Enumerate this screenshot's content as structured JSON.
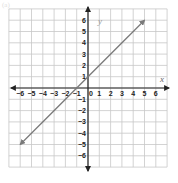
{
  "figure_label": "(a)",
  "chart_data": {
    "type": "line",
    "title": "",
    "xlabel": "x",
    "ylabel": "y",
    "xlim": [
      -6,
      6
    ],
    "ylim": [
      -6,
      6
    ],
    "grid": true,
    "x_ticks": [
      -6,
      -5,
      -4,
      -3,
      -2,
      -1,
      0,
      1,
      2,
      3,
      4,
      5,
      6
    ],
    "y_ticks": [
      -6,
      -5,
      -4,
      -3,
      -2,
      -1,
      1,
      2,
      3,
      4,
      5,
      6
    ],
    "x_tick_labels": [
      "−6",
      "−5",
      "−4",
      "−3",
      "−2",
      "−1",
      "0",
      "1",
      "2",
      "3",
      "4",
      "5",
      "6"
    ],
    "y_tick_labels": [
      "−6",
      "−5",
      "−4",
      "−3",
      "−2",
      "−1",
      "1",
      "2",
      "3",
      "4",
      "5",
      "6"
    ],
    "series": [
      {
        "name": "y = x + 1",
        "x": [
          -6,
          5
        ],
        "y": [
          -5,
          6
        ],
        "color": "#7a7a7a",
        "arrows_both_ends": true
      }
    ]
  },
  "colors": {
    "grid": "#c8c8c8",
    "axis": "#222222",
    "line": "#7a7a7a",
    "text": "#222222"
  }
}
